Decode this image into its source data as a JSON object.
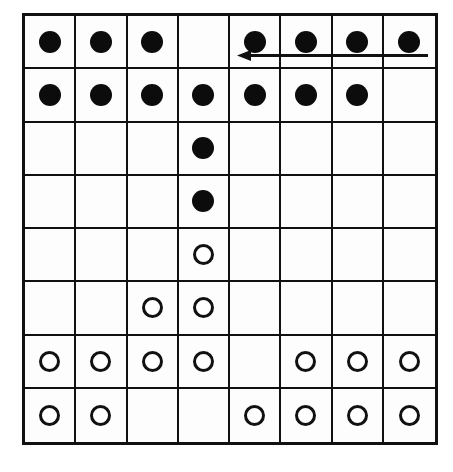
{
  "board": {
    "rows": 8,
    "cols": 8,
    "cells": [
      [
        "black",
        "black",
        "black",
        "",
        "black",
        "black",
        "black",
        "black"
      ],
      [
        "black",
        "black",
        "black",
        "black",
        "black",
        "black",
        "black",
        ""
      ],
      [
        "",
        "",
        "",
        "black",
        "",
        "",
        "",
        ""
      ],
      [
        "",
        "",
        "",
        "black",
        "",
        "",
        "",
        ""
      ],
      [
        "",
        "",
        "",
        "white",
        "",
        "",
        "",
        ""
      ],
      [
        "",
        "",
        "white",
        "white",
        "",
        "",
        "",
        ""
      ],
      [
        "white",
        "white",
        "white",
        "white",
        "",
        "white",
        "white",
        "white"
      ],
      [
        "white",
        "white",
        "",
        "",
        "white",
        "white",
        "white",
        "white"
      ]
    ],
    "colors": {
      "line": "#111111",
      "black_piece": "#0c0c0c",
      "white_piece_fill": "#ffffff",
      "background": "#ffffff"
    }
  },
  "annotations": {
    "arrow": {
      "direction": "left",
      "row": 0,
      "from_col": 7,
      "to_col": 4
    }
  }
}
